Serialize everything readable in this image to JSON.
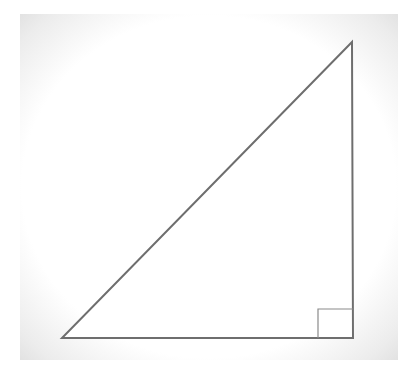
{
  "diagram": {
    "type": "right-triangle",
    "vertices": {
      "bottom_left": [
        62,
        338
      ],
      "right_angle": [
        353,
        338
      ],
      "top": [
        352,
        42
      ]
    },
    "right_angle_marker": {
      "size": 29,
      "corner": "bottom-right"
    },
    "colors": {
      "stroke": "#6e6e6e",
      "marker_stroke": "#8a8a8a",
      "fill": "#ffffff",
      "frame": "#e6e6e6"
    }
  }
}
